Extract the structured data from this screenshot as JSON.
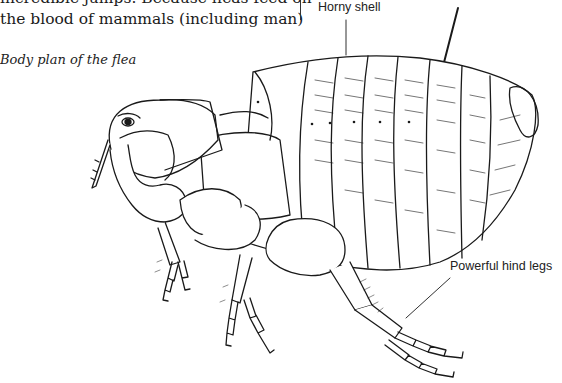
{
  "page": {
    "body_text": [
      "incredible jumps. Because fleas feed on",
      "the blood of mammals (including man)"
    ],
    "caption": "Body plan of the flea"
  },
  "figure": {
    "labels": {
      "horny_shell": "Horny shell",
      "hind_legs": "Powerful hind legs"
    }
  }
}
